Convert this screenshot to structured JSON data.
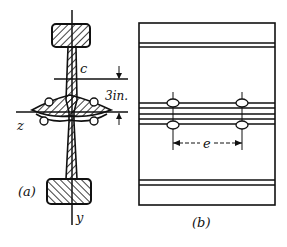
{
  "figure_a": {
    "label": "(a)",
    "axis_z": "z",
    "axis_y": "y",
    "point_c": "c",
    "dimension": "3in."
  },
  "figure_b": {
    "label": "(b)",
    "spacing": "e"
  }
}
